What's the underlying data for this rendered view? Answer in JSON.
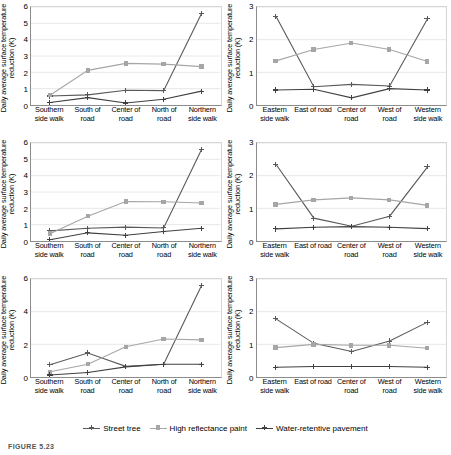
{
  "figure": {
    "caption": "FIGURE 5.23",
    "y_axis_title": "Daily average surface temperature reduction (K)",
    "series_colors": {
      "street_tree": "#595959",
      "high_reflectance_paint": "#a6a6a6",
      "water_retentive_pavement": "#404040"
    }
  },
  "legend": {
    "items": [
      {
        "label": "Street tree",
        "key": "street_tree",
        "color": "#595959",
        "marker": "cross-marker"
      },
      {
        "label": "High reflectance paint",
        "key": "high_reflectance_paint",
        "color": "#a6a6a6",
        "marker": "square-marker"
      },
      {
        "label": "Water-retentive pavement",
        "key": "water_retentive_pavement",
        "color": "#404040",
        "marker": "cross-marker"
      }
    ]
  },
  "chart_data": [
    {
      "id": "panel-top-left",
      "type": "line",
      "title": "",
      "xlabel": "",
      "ylabel": "Daily average surface temperature reduction (K)",
      "categories": [
        "Southern side walk",
        "South of road",
        "Center of road",
        "North of road",
        "Northern side walk"
      ],
      "yticks": [
        0,
        1,
        2,
        3,
        4,
        5,
        6
      ],
      "ylim": [
        0,
        6
      ],
      "grid": true,
      "legend_position": "bottom-shared",
      "series": [
        {
          "name": "Street tree",
          "color": "#595959",
          "values": [
            0.55,
            0.62,
            0.9,
            0.88,
            5.6
          ]
        },
        {
          "name": "High reflectance paint",
          "color": "#a6a6a6",
          "values": [
            0.6,
            2.12,
            2.55,
            2.5,
            2.35
          ]
        },
        {
          "name": "Water-retentive pavement",
          "color": "#404040",
          "values": [
            0.15,
            0.45,
            0.12,
            0.35,
            0.85
          ]
        }
      ]
    },
    {
      "id": "panel-top-right",
      "type": "line",
      "title": "",
      "xlabel": "",
      "ylabel": "Daily average surface temperature reduction (K)",
      "categories": [
        "Eastern side walk",
        "East of road",
        "Center of road",
        "West of road",
        "Western side walk"
      ],
      "yticks": [
        0,
        1,
        2,
        3
      ],
      "ylim": [
        0,
        3
      ],
      "grid": true,
      "legend_position": "bottom-shared",
      "series": [
        {
          "name": "Street tree",
          "color": "#595959",
          "values": [
            2.72,
            0.56,
            0.63,
            0.58,
            2.64
          ]
        },
        {
          "name": "High reflectance paint",
          "color": "#a6a6a6",
          "values": [
            1.35,
            1.7,
            1.9,
            1.7,
            1.33
          ]
        },
        {
          "name": "Water-retentive pavement",
          "color": "#404040",
          "values": [
            0.46,
            0.48,
            0.22,
            0.5,
            0.46
          ]
        }
      ]
    },
    {
      "id": "panel-middle-left",
      "type": "line",
      "title": "",
      "xlabel": "",
      "ylabel": "Daily average surface temperature reduction (K)",
      "categories": [
        "Southern side walk",
        "South of road",
        "Center of road",
        "North of road",
        "Northern side walk"
      ],
      "yticks": [
        0,
        1,
        2,
        3,
        4,
        5,
        6
      ],
      "ylim": [
        0,
        6
      ],
      "grid": true,
      "legend_position": "bottom-shared",
      "series": [
        {
          "name": "Street tree",
          "color": "#595959",
          "values": [
            0.62,
            0.78,
            0.85,
            0.8,
            5.6
          ]
        },
        {
          "name": "High reflectance paint",
          "color": "#a6a6a6",
          "values": [
            0.45,
            1.52,
            2.42,
            2.4,
            2.33
          ]
        },
        {
          "name": "Water-retentive pavement",
          "color": "#404040",
          "values": [
            0.08,
            0.5,
            0.35,
            0.58,
            0.78
          ]
        }
      ]
    },
    {
      "id": "panel-middle-right",
      "type": "line",
      "title": "",
      "xlabel": "",
      "ylabel": "Daily average surface temperature reduction (K)",
      "categories": [
        "Eastern side walk",
        "East of road",
        "Center of road",
        "West of road",
        "Western side walk"
      ],
      "yticks": [
        0,
        1,
        2,
        3
      ],
      "ylim": [
        0,
        3
      ],
      "grid": true,
      "legend_position": "bottom-shared",
      "series": [
        {
          "name": "Street tree",
          "color": "#595959",
          "values": [
            2.35,
            0.7,
            0.45,
            0.76,
            2.27
          ]
        },
        {
          "name": "High reflectance paint",
          "color": "#a6a6a6",
          "values": [
            1.12,
            1.26,
            1.32,
            1.26,
            1.09
          ]
        },
        {
          "name": "Water-retentive pavement",
          "color": "#404040",
          "values": [
            0.37,
            0.42,
            0.44,
            0.42,
            0.38
          ]
        }
      ]
    },
    {
      "id": "panel-bottom-left",
      "type": "line",
      "title": "",
      "xlabel": "",
      "ylabel": "Daily average surface temperature reduction (K)",
      "categories": [
        "Southern side walk",
        "South of road",
        "Center of road",
        "North of road",
        "Northern side walk"
      ],
      "yticks": [
        0,
        2,
        4,
        6
      ],
      "ylim": [
        0,
        6
      ],
      "grid": true,
      "legend_position": "bottom-shared",
      "series": [
        {
          "name": "Street tree",
          "color": "#595959",
          "values": [
            0.75,
            1.47,
            0.65,
            0.78,
            5.6
          ]
        },
        {
          "name": "High reflectance paint",
          "color": "#a6a6a6",
          "values": [
            0.32,
            0.78,
            1.85,
            2.33,
            2.27
          ]
        },
        {
          "name": "Water-retentive pavement",
          "color": "#404040",
          "values": [
            0.12,
            0.28,
            0.62,
            0.78,
            0.78
          ]
        }
      ]
    },
    {
      "id": "panel-bottom-right",
      "type": "line",
      "title": "",
      "xlabel": "",
      "ylabel": "Daily average surface temperature reduction (K)",
      "categories": [
        "Eastern side walk",
        "East of road",
        "Center of road",
        "West of road",
        "Western side walk"
      ],
      "yticks": [
        0,
        1,
        2,
        3
      ],
      "ylim": [
        0,
        3
      ],
      "grid": true,
      "legend_position": "bottom-shared",
      "series": [
        {
          "name": "Street tree",
          "color": "#595959",
          "values": [
            1.78,
            1.03,
            0.78,
            1.1,
            1.68
          ]
        },
        {
          "name": "High reflectance paint",
          "color": "#a6a6a6",
          "values": [
            0.9,
            1.0,
            0.97,
            0.97,
            0.88
          ]
        },
        {
          "name": "Water-retentive pavement",
          "color": "#404040",
          "values": [
            0.3,
            0.32,
            0.32,
            0.32,
            0.3
          ]
        }
      ]
    }
  ]
}
